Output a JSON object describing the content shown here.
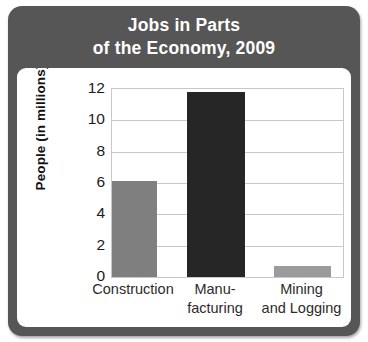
{
  "chart_data": {
    "type": "bar",
    "title": "Jobs in Parts of the Economy, 2009",
    "title_lines": [
      "Jobs in Parts",
      "of the Economy, 2009"
    ],
    "categories": [
      "Construction",
      "Manufacturing",
      "Mining and Logging"
    ],
    "category_label_lines": [
      [
        "Construction"
      ],
      [
        "Manu-",
        "facturing"
      ],
      [
        "Mining",
        "and Logging"
      ]
    ],
    "values": [
      6.1,
      11.8,
      0.7
    ],
    "xlabel": "",
    "ylabel": "People (in millions)",
    "ylim": [
      0,
      12
    ],
    "yticks": [
      0,
      2,
      4,
      6,
      8,
      10,
      12
    ],
    "ytick_labels": [
      "0",
      "2",
      "4",
      "6",
      "8",
      "10",
      "12"
    ],
    "grid": true,
    "legend": "none",
    "bar_colors": [
      "#7f7f7f",
      "#262626",
      "#9b9b9b"
    ]
  },
  "style": {
    "frame_color": "#565656",
    "title_color": "#ffffff",
    "plot_background": "#ffffff",
    "gridline_color": "#c8c8c8",
    "tick_text_color": "#1b1b1b",
    "axis_label_color": "#111111"
  }
}
